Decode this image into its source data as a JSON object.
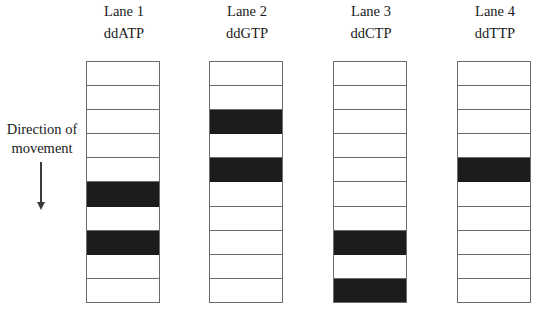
{
  "figure": {
    "type": "sanger-sequencing-gel-diagram",
    "background_color": "#ffffff",
    "band_color": "#1c1c1c",
    "lane_border_color": "#6b6b6b"
  },
  "annotation": {
    "direction_line1": "Direction of",
    "direction_line2": "movement",
    "arrow_icon": "down-arrow-icon",
    "arrow_direction": "down"
  },
  "lanes": [
    {
      "title": "Lane 1",
      "subtitle": "ddATP",
      "slot_count": 10,
      "bands": [
        6,
        8
      ]
    },
    {
      "title": "Lane 2",
      "subtitle": "ddGTP",
      "slot_count": 10,
      "bands": [
        3,
        5
      ]
    },
    {
      "title": "Lane 3",
      "subtitle": "ddCTP",
      "slot_count": 10,
      "bands": [
        8,
        10
      ]
    },
    {
      "title": "Lane 4",
      "subtitle": "ddTTP",
      "slot_count": 10,
      "bands": [
        5
      ]
    }
  ]
}
